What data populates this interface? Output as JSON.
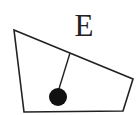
{
  "diagram": {
    "label": "E",
    "colors": {
      "stroke": "#222222",
      "fill": "#111111",
      "background": "#ffffff"
    },
    "shape": {
      "type": "quadrilateral",
      "points": "14,30 133,79 123,111 24,112"
    },
    "pendulum": {
      "line": {
        "x1": 70,
        "y1": 53,
        "x2": 58,
        "y2": 92
      },
      "bob": {
        "cx": 58,
        "cy": 97,
        "r": 9
      }
    }
  }
}
